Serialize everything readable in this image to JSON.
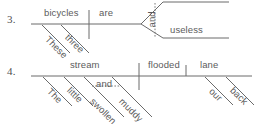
{
  "page": {
    "background_color": "#ffffff",
    "ink_color": "#6b6b6b",
    "text_color": "#5a5a5a",
    "width": 262,
    "height": 124
  },
  "exercises": [
    {
      "number": "3.",
      "sentence_words": {
        "subject": "bicycles",
        "verb": "are",
        "conjunction": "and",
        "complement": "useless",
        "modifier_1": "These",
        "modifier_2": "three"
      }
    },
    {
      "number": "4.",
      "sentence_words": {
        "subject": "stream",
        "verb": "flooded",
        "object": "lane",
        "conjunction": "and",
        "modifier_1": "The",
        "modifier_2": "little",
        "modifier_3": "swollen",
        "modifier_4": "muddy",
        "modifier_5": "our",
        "modifier_6": "back"
      }
    }
  ],
  "diagram3": {
    "number": "3.",
    "baseline_words": [
      {
        "text": "bicycles"
      },
      {
        "text": "are"
      },
      {
        "text": "useless"
      }
    ],
    "conjunction": "and",
    "slanted_words": [
      {
        "text": "These"
      },
      {
        "text": "three"
      }
    ]
  },
  "diagram4": {
    "number": "4.",
    "baseline_words": [
      {
        "text": "stream"
      },
      {
        "text": "flooded"
      },
      {
        "text": "lane"
      }
    ],
    "conjunction": "and",
    "slanted_words": [
      {
        "text": "The"
      },
      {
        "text": "little"
      },
      {
        "text": "swollen"
      },
      {
        "text": "muddy"
      },
      {
        "text": "our"
      },
      {
        "text": "back"
      }
    ]
  }
}
